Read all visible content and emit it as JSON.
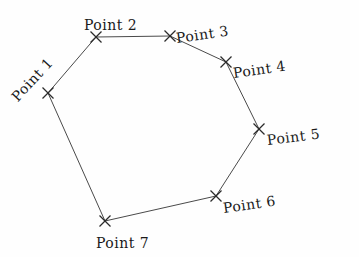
{
  "diagram": {
    "background_color": "#fefefe",
    "line_color": "#4a4a4a",
    "marker_color": "#2b2b2b",
    "text_color": "#1a1a1a",
    "marker_glyph": "x",
    "shape": "closed heptagon polygon",
    "vertices": [
      {
        "id": "p1",
        "label": "Point 1",
        "x": 48,
        "y": 93,
        "label_x": 14,
        "label_y": 92,
        "rotation": -47
      },
      {
        "id": "p2",
        "label": "Point 2",
        "x": 96,
        "y": 37,
        "label_x": 84,
        "label_y": 18,
        "rotation": 0
      },
      {
        "id": "p3",
        "label": "Point 3",
        "x": 170,
        "y": 36,
        "label_x": 176,
        "label_y": 31,
        "rotation": -8
      },
      {
        "id": "p4",
        "label": "Point 4",
        "x": 226,
        "y": 62,
        "label_x": 233,
        "label_y": 66,
        "rotation": -8
      },
      {
        "id": "p5",
        "label": "Point 5",
        "x": 259,
        "y": 129,
        "label_x": 267,
        "label_y": 133,
        "rotation": -7
      },
      {
        "id": "p6",
        "label": "Point 6",
        "x": 216,
        "y": 196,
        "label_x": 223,
        "label_y": 201,
        "rotation": -8
      },
      {
        "id": "p7",
        "label": "Point 7",
        "x": 105,
        "y": 221,
        "label_x": 96,
        "label_y": 236,
        "rotation": 0
      }
    ],
    "edges": [
      {
        "from": "p1",
        "to": "p2"
      },
      {
        "from": "p2",
        "to": "p3"
      },
      {
        "from": "p3",
        "to": "p4"
      },
      {
        "from": "p4",
        "to": "p5"
      },
      {
        "from": "p5",
        "to": "p6"
      },
      {
        "from": "p6",
        "to": "p7"
      },
      {
        "from": "p7",
        "to": "p1"
      }
    ]
  }
}
